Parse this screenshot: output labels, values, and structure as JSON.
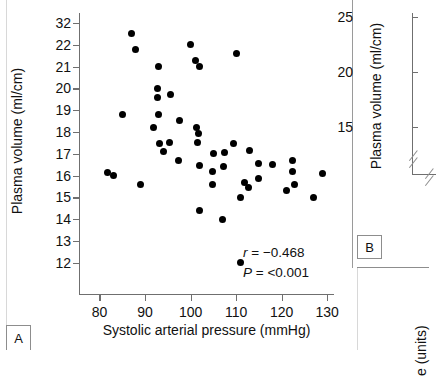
{
  "figure": {
    "panel_a_letter": "A",
    "panel_b_letter": "B"
  },
  "chart_data": {
    "type": "scatter",
    "title": "",
    "xlabel": "Systolic arterial pressure (mmHg)",
    "ylabel": "Plasma volume (ml/cm)",
    "xlim": [
      75.5,
      131.5
    ],
    "ylim_labels_note": "y tick labels as printed in the figure, top tick printed as 32",
    "xticks": [
      80,
      90,
      100,
      110,
      120,
      130
    ],
    "yticks": [
      "32",
      "22",
      "21",
      "20",
      "19",
      "18",
      "17",
      "16",
      "15",
      "14",
      "13",
      "12"
    ],
    "grid": false,
    "legend": null,
    "annotations": {
      "r_symbol": "r",
      "r_text": " = −0.468",
      "p_symbol": "P",
      "p_text": " = <0.001"
    },
    "points": [
      {
        "x": 87.0,
        "y": 22.5
      },
      {
        "x": 88.0,
        "y": 21.8
      },
      {
        "x": 100.0,
        "y": 22.0
      },
      {
        "x": 101.0,
        "y": 21.3
      },
      {
        "x": 102.0,
        "y": 21.0
      },
      {
        "x": 93.0,
        "y": 21.0
      },
      {
        "x": 110.0,
        "y": 21.6
      },
      {
        "x": 92.8,
        "y": 20.0
      },
      {
        "x": 92.8,
        "y": 19.6
      },
      {
        "x": 95.5,
        "y": 19.7
      },
      {
        "x": 85.0,
        "y": 18.8
      },
      {
        "x": 93.0,
        "y": 18.8
      },
      {
        "x": 91.8,
        "y": 18.2
      },
      {
        "x": 97.5,
        "y": 18.55
      },
      {
        "x": 101.3,
        "y": 18.2
      },
      {
        "x": 101.8,
        "y": 17.95
      },
      {
        "x": 93.2,
        "y": 17.45
      },
      {
        "x": 95.3,
        "y": 17.5
      },
      {
        "x": 94.0,
        "y": 17.1
      },
      {
        "x": 101.5,
        "y": 17.5
      },
      {
        "x": 109.5,
        "y": 17.45
      },
      {
        "x": 113.0,
        "y": 17.15
      },
      {
        "x": 105.0,
        "y": 17.0
      },
      {
        "x": 107.5,
        "y": 17.05
      },
      {
        "x": 97.3,
        "y": 16.7
      },
      {
        "x": 102.0,
        "y": 16.45
      },
      {
        "x": 104.8,
        "y": 16.2
      },
      {
        "x": 107.3,
        "y": 16.4
      },
      {
        "x": 115.0,
        "y": 16.55
      },
      {
        "x": 118.0,
        "y": 16.5
      },
      {
        "x": 122.3,
        "y": 16.7
      },
      {
        "x": 122.3,
        "y": 16.2
      },
      {
        "x": 129.0,
        "y": 16.1
      },
      {
        "x": 81.8,
        "y": 16.15
      },
      {
        "x": 83.0,
        "y": 16.0
      },
      {
        "x": 104.8,
        "y": 15.6
      },
      {
        "x": 111.8,
        "y": 15.7
      },
      {
        "x": 112.8,
        "y": 15.45
      },
      {
        "x": 115.0,
        "y": 15.85
      },
      {
        "x": 122.8,
        "y": 15.6
      },
      {
        "x": 121.0,
        "y": 15.3
      },
      {
        "x": 89.0,
        "y": 15.6
      },
      {
        "x": 111.0,
        "y": 15.0
      },
      {
        "x": 127.0,
        "y": 15.0
      },
      {
        "x": 102.0,
        "y": 14.4
      },
      {
        "x": 107.0,
        "y": 14.0
      },
      {
        "x": 111.0,
        "y": 12.0
      }
    ]
  },
  "right_panel": {
    "ylabel": "Plasma volume (ml/cm)",
    "yticks": [
      "25",
      "20",
      "15"
    ],
    "bottom_label_fragment": "e (units)"
  }
}
